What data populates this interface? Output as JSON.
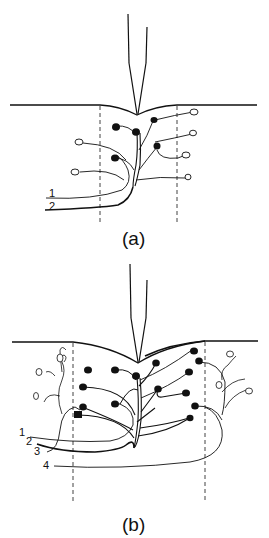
{
  "panels": [
    {
      "id": "a",
      "caption": "(a)",
      "curve_labels": [
        "1",
        "2"
      ]
    },
    {
      "id": "b",
      "caption": "(b)",
      "curve_labels": [
        "1",
        "2",
        "3",
        "4"
      ]
    }
  ],
  "colors": {
    "line": "#111111",
    "background": "#ffffff"
  }
}
